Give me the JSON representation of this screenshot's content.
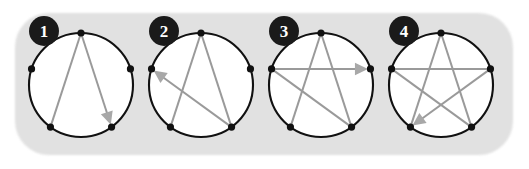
{
  "figure": {
    "background_color": "#dcdcdc",
    "circle_stroke_color": "#111111",
    "vertex_color": "#111111",
    "chord_color": "#9a9a9a",
    "arrow_color": "#a8a8a8",
    "badge_fill": "#1a1a1a",
    "badge_text_color": "#ffffff",
    "canvas": {
      "width": 529,
      "height": 169
    },
    "blob": {
      "x": 15,
      "y": 13,
      "width": 498,
      "height": 142,
      "corner_radius": 34
    },
    "geometry": {
      "radius": 52,
      "center_y": 85,
      "vertex_dot_radius": 3.6,
      "vertex_angles_deg": [
        270,
        342,
        54,
        126,
        198
      ],
      "vertex_names": [
        "top",
        "upper-right",
        "lower-right",
        "lower-left",
        "upper-left"
      ]
    },
    "panels": [
      {
        "id": "panel-1",
        "number": "1",
        "center_x": 81,
        "badge": {
          "cx": 44,
          "cy": 31,
          "r": 15
        },
        "chords": [
          {
            "from": 0,
            "to": 3,
            "arrow": false
          },
          {
            "from": 0,
            "to": 2,
            "arrow": true
          }
        ]
      },
      {
        "id": "panel-2",
        "number": "2",
        "center_x": 201,
        "badge": {
          "cx": 164,
          "cy": 31,
          "r": 15
        },
        "chords": [
          {
            "from": 0,
            "to": 3,
            "arrow": false
          },
          {
            "from": 0,
            "to": 2,
            "arrow": false
          },
          {
            "from": 2,
            "to": 4,
            "arrow": true
          }
        ]
      },
      {
        "id": "panel-3",
        "number": "3",
        "center_x": 321,
        "badge": {
          "cx": 284,
          "cy": 31,
          "r": 15
        },
        "chords": [
          {
            "from": 0,
            "to": 3,
            "arrow": false
          },
          {
            "from": 0,
            "to": 2,
            "arrow": false
          },
          {
            "from": 2,
            "to": 4,
            "arrow": false
          },
          {
            "from": 4,
            "to": 1,
            "arrow": true
          }
        ]
      },
      {
        "id": "panel-4",
        "number": "4",
        "center_x": 441,
        "badge": {
          "cx": 404,
          "cy": 31,
          "r": 15
        },
        "chords": [
          {
            "from": 0,
            "to": 3,
            "arrow": false
          },
          {
            "from": 0,
            "to": 2,
            "arrow": false
          },
          {
            "from": 2,
            "to": 4,
            "arrow": false
          },
          {
            "from": 4,
            "to": 1,
            "arrow": false
          },
          {
            "from": 1,
            "to": 3,
            "arrow": true
          }
        ]
      }
    ]
  }
}
